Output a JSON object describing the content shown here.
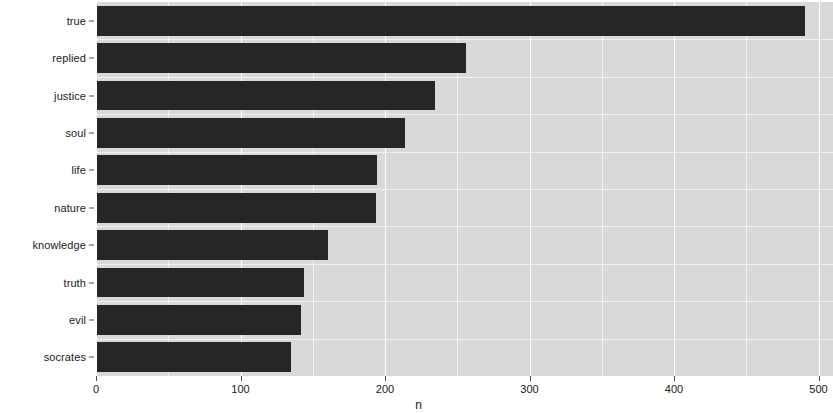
{
  "chart_data": {
    "type": "bar",
    "orientation": "horizontal",
    "title": "",
    "subtitle": "",
    "xlabel": "n",
    "ylabel": "",
    "categories": [
      "true",
      "replied",
      "justice",
      "soul",
      "life",
      "nature",
      "knowledge",
      "truth",
      "evil",
      "socrates"
    ],
    "values": [
      490,
      255,
      234,
      213,
      194,
      193,
      160,
      143,
      141,
      134
    ],
    "xlim": [
      0,
      510
    ],
    "ylim": null,
    "x_ticks": [
      0,
      100,
      200,
      300,
      400,
      500
    ],
    "x_tick_labels": [
      "0",
      "100",
      "200",
      "300",
      "400",
      "500"
    ],
    "x_minor_ticks": [
      50,
      150,
      250,
      350,
      450
    ],
    "y_tick_labels": [
      "true",
      "replied",
      "justice",
      "soul",
      "life",
      "nature",
      "knowledge",
      "truth",
      "evil",
      "socrates"
    ],
    "legend": null,
    "legend_position": "none",
    "grid": true,
    "grid_color": "#ffffff",
    "panel_background": "#d9d9d9",
    "bar_color": "#262626",
    "plot_background": "#ffffff",
    "annotations": []
  },
  "axis": {
    "x_title": "n"
  }
}
